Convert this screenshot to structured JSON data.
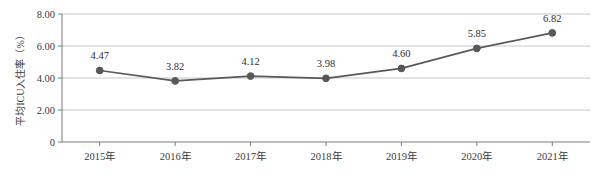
{
  "chart_data": {
    "type": "line",
    "title": "",
    "xlabel": "",
    "ylabel": "平均ICU入住率（%）",
    "categories": [
      "2015年",
      "2016年",
      "2017年",
      "2018年",
      "2019年",
      "2020年",
      "2021年"
    ],
    "values": [
      4.47,
      3.82,
      4.12,
      3.98,
      4.6,
      5.85,
      6.82
    ],
    "data_labels": [
      "4.47",
      "3.82",
      "4.12",
      "3.98",
      "4.60",
      "5.85",
      "6.82"
    ],
    "ylim": [
      0,
      8
    ],
    "ytick_values": [
      0,
      2,
      4,
      6,
      8
    ],
    "ytick_labels": [
      "0",
      "2.00",
      "4.00",
      "6.00",
      "8.00"
    ],
    "grid": true,
    "legend": "none",
    "series": [
      {
        "name": "平均ICU入住率（%）",
        "values": [
          4.47,
          3.82,
          4.12,
          3.98,
          4.6,
          5.85,
          6.82
        ]
      }
    ],
    "colors": {
      "line": "#595959",
      "marker": "#585858",
      "gridline": "#c8c8c8",
      "axis": "#7a7a7a",
      "background": "#ffffff",
      "text": "#3a3a3a"
    }
  }
}
